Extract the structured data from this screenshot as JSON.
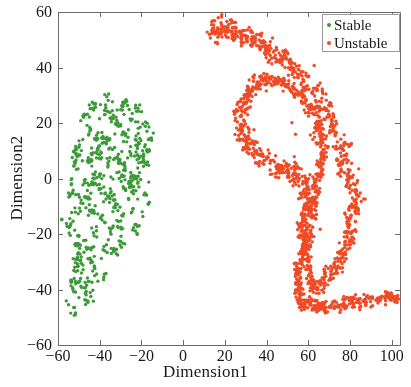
{
  "chart_data": {
    "type": "scatter",
    "title": "",
    "xlabel": "Dimension1",
    "ylabel": "Dimension2",
    "xlim": [
      -60,
      104
    ],
    "ylim": [
      -60,
      60
    ],
    "xticks": [
      -60,
      -40,
      -20,
      0,
      20,
      40,
      60,
      80,
      100
    ],
    "xticklabels": [
      "−60",
      "−40",
      "−20",
      "0",
      "20",
      "40",
      "60",
      "80",
      "100"
    ],
    "yticks": [
      -60,
      -40,
      -20,
      0,
      20,
      40,
      60
    ],
    "yticklabels": [
      "−60",
      "−40",
      "−20",
      "0",
      "20",
      "40",
      "60"
    ],
    "grid": false,
    "legend_position": "upper right",
    "marker_size": 3,
    "series": [
      {
        "name": "Stable",
        "color": "#3c9a39",
        "n_points": 620,
        "x_range": [
          -56,
          -12
        ],
        "y_range": [
          -52,
          31
        ],
        "shape": "blob",
        "description": "Dense irregular green blob occupying the left of the plot, widest between Dimension2 = -20 and 28, tapering to a narrow tail toward the lower-left near Dimension1 = -52, Dimension2 = -50."
      },
      {
        "name": "Unstable",
        "color": "#ef4b27",
        "n_points": 980,
        "x_range": [
          12,
          104
        ],
        "y_range": [
          -50,
          55
        ],
        "shape": "arc",
        "description": "Orange-red C-shaped arc opening left. Begins near Dimension1 = 13, Dimension2 = 54, sweeps right and down along the outer edge to Dimension1 = 84, curls back inward near Dimension1 = 58, Dimension2 = -20, then runs right along the bottom to Dimension1 = 104, Dimension2 = -44."
      }
    ]
  },
  "legend": {
    "entries": [
      {
        "label": "Stable",
        "color": "#3c9a39"
      },
      {
        "label": "Unstable",
        "color": "#ef4b27"
      }
    ]
  }
}
